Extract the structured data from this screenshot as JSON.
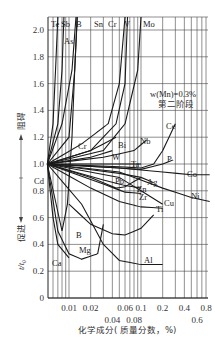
{
  "chart_data": {
    "type": "line",
    "title": "",
    "annotation": [
      "w(Mn)=0.3%",
      "第二阶段"
    ],
    "xlabel": "化学成分(质量分数，%)",
    "ylabel": "t/t0",
    "ylabel_up": "阻碍",
    "ylabel_down": "促进",
    "xscale": "log",
    "xlim": [
      0.005,
      0.9
    ],
    "ylim": [
      0,
      2.1
    ],
    "grid": true,
    "x_ticks_row1": [
      "0.01",
      "0.02",
      "0.06",
      "0.1",
      "0.2",
      "0.4",
      "0.8"
    ],
    "x_ticks_row2": [
      "0.04",
      "0.08",
      "0.6"
    ],
    "y_ticks": [
      "0",
      "0.2",
      "0.4",
      "0.6",
      "0.8",
      "1.0",
      "1.2",
      "1.4",
      "1.6",
      "1.8",
      "2.0"
    ],
    "series": [
      {
        "name": "Te",
        "x": [
          0.005,
          0.006,
          0.0065,
          0.007
        ],
        "y": [
          1.0,
          1.3,
          1.7,
          2.1
        ]
      },
      {
        "name": "Sb",
        "x": [
          0.005,
          0.007,
          0.008,
          0.0085
        ],
        "y": [
          1.0,
          1.3,
          1.7,
          2.1
        ]
      },
      {
        "name": "As",
        "x": [
          0.005,
          0.008,
          0.011,
          0.0125
        ],
        "y": [
          1.0,
          1.3,
          1.7,
          2.1
        ]
      },
      {
        "name": "B",
        "x": [
          0.005,
          0.008,
          0.0095,
          0.011,
          0.012,
          0.013
        ],
        "y": [
          1.0,
          0.5,
          0.7,
          1.2,
          1.7,
          2.1
        ]
      },
      {
        "name": "Sn",
        "x": [
          0.005,
          0.01,
          0.012,
          0.013
        ],
        "y": [
          1.0,
          1.2,
          1.7,
          2.1
        ]
      },
      {
        "name": "Cr",
        "x": [
          0.005,
          0.015,
          0.035,
          0.05,
          0.06
        ],
        "y": [
          1.0,
          1.15,
          1.3,
          1.6,
          2.1
        ]
      },
      {
        "name": "V",
        "x": [
          0.005,
          0.02,
          0.045,
          0.06,
          0.065
        ],
        "y": [
          1.0,
          1.1,
          1.3,
          1.6,
          2.1
        ]
      },
      {
        "name": "Mo",
        "x": [
          0.005,
          0.03,
          0.06,
          0.09,
          0.1
        ],
        "y": [
          1.0,
          1.1,
          1.3,
          1.7,
          2.1
        ]
      },
      {
        "name": "Bi",
        "x": [
          0.005,
          0.02,
          0.045
        ],
        "y": [
          1.0,
          1.1,
          1.2
        ]
      },
      {
        "name": "W",
        "x": [
          0.005,
          0.02,
          0.04
        ],
        "y": [
          1.0,
          1.05,
          1.1
        ]
      },
      {
        "name": "Nb",
        "x": [
          0.005,
          0.03,
          0.08,
          0.12
        ],
        "y": [
          1.0,
          1.05,
          1.1,
          1.18
        ]
      },
      {
        "name": "Ta",
        "x": [
          0.005,
          0.03,
          0.1
        ],
        "y": [
          1.0,
          1.0,
          1.0
        ]
      },
      {
        "name": "Ce",
        "x": [
          0.005,
          0.05,
          0.1,
          0.15,
          0.2,
          0.3
        ],
        "y": [
          1.0,
          0.98,
          0.97,
          1.0,
          1.1,
          1.3
        ]
      },
      {
        "name": "P",
        "x": [
          0.005,
          0.05,
          0.1,
          0.2,
          0.28
        ],
        "y": [
          1.0,
          0.97,
          0.96,
          1.0,
          1.03
        ]
      },
      {
        "name": "Co",
        "x": [
          0.005,
          0.05,
          0.2,
          0.5,
          0.9
        ],
        "y": [
          1.0,
          0.97,
          0.94,
          0.92,
          0.92
        ]
      },
      {
        "name": "Pb",
        "x": [
          0.005,
          0.02,
          0.045,
          0.06,
          0.08,
          0.1
        ],
        "y": [
          1.0,
          0.9,
          0.82,
          0.83,
          0.87,
          0.9
        ]
      },
      {
        "name": "Ag",
        "x": [
          0.005,
          0.05,
          0.1,
          0.15
        ],
        "y": [
          1.0,
          0.93,
          0.9,
          0.86
        ]
      },
      {
        "name": "Zn",
        "x": [
          0.005,
          0.03,
          0.06,
          0.1
        ],
        "y": [
          1.0,
          0.88,
          0.84,
          0.82
        ]
      },
      {
        "name": "Zr",
        "x": [
          0.005,
          0.03,
          0.06,
          0.1
        ],
        "y": [
          1.0,
          0.85,
          0.79,
          0.78
        ]
      },
      {
        "name": "Cu",
        "x": [
          0.005,
          0.05,
          0.1,
          0.2
        ],
        "y": [
          1.0,
          0.9,
          0.8,
          0.7
        ]
      },
      {
        "name": "Ni",
        "x": [
          0.005,
          0.05,
          0.2,
          0.5,
          0.9
        ],
        "y": [
          1.0,
          0.94,
          0.82,
          0.75,
          0.72
        ]
      },
      {
        "name": "Ti",
        "x": [
          0.005,
          0.02,
          0.05,
          0.1,
          0.2
        ],
        "y": [
          1.0,
          0.82,
          0.72,
          0.68,
          0.67
        ]
      },
      {
        "name": "Cd",
        "x": [
          0.005
        ],
        "y": [
          1.0
        ]
      },
      {
        "name": "Al",
        "x": [
          0.005,
          0.015,
          0.03,
          0.05,
          0.1,
          0.2
        ],
        "y": [
          1.0,
          0.7,
          0.4,
          0.28,
          0.25,
          0.25
        ]
      },
      {
        "name": "Mg",
        "x": [
          0.005,
          0.007,
          0.01,
          0.015,
          0.025,
          0.03
        ],
        "y": [
          1.0,
          0.5,
          0.33,
          0.29,
          0.33,
          0.55
        ]
      },
      {
        "name": "Ca",
        "x": [
          0.005,
          0.006,
          0.007,
          0.01
        ],
        "y": [
          1.0,
          0.6,
          0.4,
          0.3
        ]
      },
      {
        "name": "Unlabeled-min",
        "x": [
          0.01,
          0.02,
          0.04,
          0.06,
          0.1,
          0.15
        ],
        "y": [
          0.7,
          0.55,
          0.48,
          0.47,
          0.52,
          0.62
        ]
      }
    ]
  },
  "labels": {
    "ylabel_up": "阻碍",
    "ylabel_down": "促进",
    "ylabel": "t/t₀",
    "xlabel": "化学成分( 质量分数，%)",
    "annot1": "w(Mn)=0.3%",
    "annot2": "第二阶段"
  }
}
